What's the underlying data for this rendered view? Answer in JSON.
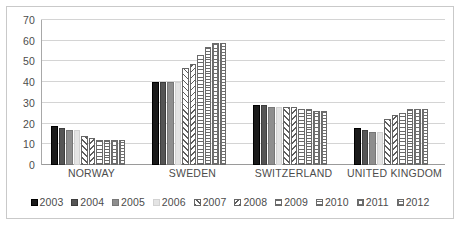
{
  "chart_data": {
    "type": "bar",
    "title": "",
    "subtitle": "",
    "xlabel": "",
    "ylabel": "",
    "ylim": [
      0,
      70
    ],
    "ytick_step": 10,
    "yticks": [
      70,
      60,
      50,
      40,
      30,
      20,
      10,
      0
    ],
    "grid": true,
    "legend_position": "bottom",
    "categories": [
      "NORWAY",
      "SWEDEN",
      "SWITZERLAND",
      "UNITED KINGDOM"
    ],
    "series": [
      {
        "name": "2003",
        "fill": "solid-black",
        "swatch_color": "#1a1a1a",
        "values": [
          19,
          40,
          29,
          18
        ]
      },
      {
        "name": "2004",
        "fill": "solid-dark",
        "swatch_color": "#555555",
        "values": [
          18,
          40,
          29,
          17
        ]
      },
      {
        "name": "2005",
        "fill": "solid-mid",
        "swatch_color": "#8e8e8e",
        "values": [
          17,
          40,
          28,
          16
        ]
      },
      {
        "name": "2006",
        "fill": "solid-light",
        "swatch_color": "#e4e4e4",
        "values": [
          17,
          40,
          28,
          16
        ]
      },
      {
        "name": "2007",
        "fill": "diag-a",
        "swatch_color": "#ffffff",
        "values": [
          14,
          47,
          28,
          22
        ]
      },
      {
        "name": "2008",
        "fill": "diag-b",
        "swatch_color": "#ffffff",
        "values": [
          13,
          49,
          28,
          24
        ]
      },
      {
        "name": "2009",
        "fill": "horiz",
        "swatch_color": "#ffffff",
        "values": [
          12,
          53,
          27,
          25
        ]
      },
      {
        "name": "2010",
        "fill": "horiz-dense",
        "swatch_color": "#ffffff",
        "values": [
          12,
          57,
          27,
          27
        ]
      },
      {
        "name": "2011",
        "fill": "grid",
        "swatch_color": "#ffffff",
        "values": [
          12,
          59,
          26,
          27
        ]
      },
      {
        "name": "2012",
        "fill": "grid-fine",
        "swatch_color": "#ffffff",
        "values": [
          12,
          59,
          26,
          27
        ]
      }
    ]
  }
}
